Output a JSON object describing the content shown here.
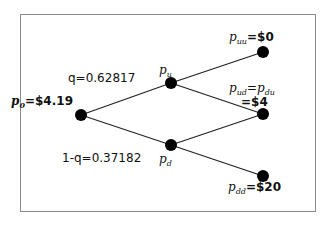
{
  "diagram": {
    "type": "binomial-tree",
    "frame_color": "#8a8a8a",
    "edge_color": "#222222",
    "node_color": "#000000",
    "nodes": {
      "p0": {
        "sym": "p",
        "sub": "0",
        "eq": "=$4.19",
        "x": 81,
        "y": 115
      },
      "pu": {
        "sym": "p",
        "sub": "u",
        "x": 171,
        "y": 83
      },
      "pd": {
        "sym": "p",
        "sub": "d",
        "x": 171,
        "y": 145
      },
      "puu": {
        "sym": "p",
        "sub": "uu",
        "eq": "=$0",
        "x": 263,
        "y": 52
      },
      "pud": {
        "sym": "p",
        "sub": "ud",
        "eq_mid": "=",
        "sym2": "p",
        "sub2": "du",
        "eq2": "=$4",
        "x": 263,
        "y": 114
      },
      "pdd": {
        "sym": "p",
        "sub": "dd",
        "eq": "=$20",
        "x": 263,
        "y": 176
      }
    },
    "edge_labels": {
      "up_prob": "q=0.62817",
      "down_prob": "1-q=0.37182"
    }
  }
}
